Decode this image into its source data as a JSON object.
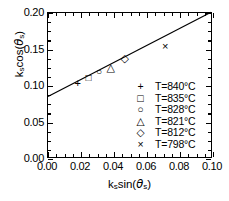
{
  "chart_data": {
    "type": "scatter",
    "title": "",
    "xlabel": "k_s sin(theta_s)",
    "ylabel": "k_s cos(theta_s)",
    "xlim": [
      0.0,
      0.1
    ],
    "ylim": [
      0.0,
      0.2
    ],
    "xticks": [
      "0.00",
      "0.02",
      "0.04",
      "0.06",
      "0.08",
      "0.10"
    ],
    "xtick_values": [
      0.0,
      0.02,
      0.04,
      0.06,
      0.08,
      0.1
    ],
    "yticks": [
      "0.00",
      "0.05",
      "0.10",
      "0.15",
      "0.20"
    ],
    "ytick_values": [
      0.0,
      0.05,
      0.1,
      0.15,
      0.2
    ],
    "minor_ticks_per_major": 4,
    "grid": false,
    "legend_position": "lower-right",
    "frame": "box",
    "tick_direction": "in",
    "points": [
      {
        "label": "T=840°C",
        "marker": "plus",
        "x": 0.018,
        "y": 0.104
      },
      {
        "label": "T=835°C",
        "marker": "square",
        "x": 0.0245,
        "y": 0.111
      },
      {
        "label": "T=828°C",
        "marker": "circle",
        "x": 0.031,
        "y": 0.119
      },
      {
        "label": "T=821°C",
        "marker": "triangle",
        "x": 0.038,
        "y": 0.126
      },
      {
        "label": "T=812°C",
        "marker": "diamond",
        "x": 0.0465,
        "y": 0.138
      },
      {
        "label": "T=798°C",
        "marker": "cross",
        "x": 0.071,
        "y": 0.155
      }
    ],
    "fit_line": {
      "x0": 0.0,
      "y0": 0.084,
      "x1": 0.1,
      "y1": 0.201,
      "slope": 1.17,
      "intercept": 0.084
    }
  },
  "axis": {
    "x_title_main": "k",
    "x_title_sub1": "s",
    "x_title_fn": "sin(",
    "x_title_theta": "θ",
    "x_title_sub2": "s",
    "x_title_close": ")",
    "y_title_main": "k",
    "y_title_sub1": "s",
    "y_title_fn": "cos(",
    "y_title_theta": "θ",
    "y_title_sub2": "s",
    "y_title_close": ")"
  },
  "legend": {
    "items": [
      {
        "symbol": "+",
        "label": "T=840°C"
      },
      {
        "symbol": "□",
        "label": "T=835°C"
      },
      {
        "symbol": "○",
        "label": "T=828°C"
      },
      {
        "symbol": "△",
        "label": "T=821°C"
      },
      {
        "symbol": "◇",
        "label": "T=812°C"
      },
      {
        "symbol": "×",
        "label": "T=798°C"
      }
    ]
  },
  "colors": {
    "ink": "#000000",
    "background": "#ffffff"
  }
}
